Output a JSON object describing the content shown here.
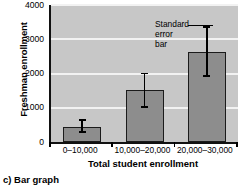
{
  "caption": "c) Bar graph",
  "annotation": {
    "lines": [
      "Standard",
      "error",
      "bar"
    ],
    "line1": "Standard",
    "line2": "error",
    "line3": "bar"
  },
  "colors": {
    "plot_background": "#c7c7c7",
    "gridline": "#f2f2f2",
    "bar_fill": "#8d8d8d",
    "bar_outline": "#1b1b1b",
    "axis": "#111111",
    "error_bar": "#000000",
    "page_background": "#ffffff",
    "text": "#000000"
  },
  "chart_data": {
    "type": "bar",
    "title": "",
    "xlabel": "Total student enrollment",
    "ylabel": "Freshman enrollment",
    "categories": [
      "0–10,000",
      "10,000–20,000",
      "20,000–30,000"
    ],
    "values": [
      440,
      1520,
      2630
    ],
    "error_low": [
      300,
      1020,
      1920
    ],
    "error_high": [
      640,
      2000,
      3360
    ],
    "yticks": [
      0,
      1000,
      2000,
      3000,
      4000
    ],
    "ytick_labels": [
      "0",
      "1000",
      "2000",
      "3000",
      "4000"
    ],
    "ylim": [
      0,
      4000
    ],
    "grid": true,
    "legend": false,
    "annotations": [
      {
        "text": "Standard error bar",
        "points_to_series_index": 2,
        "points_to": "error-bar-top"
      }
    ]
  }
}
